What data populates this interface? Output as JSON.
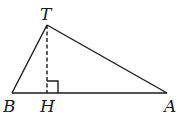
{
  "diagram": {
    "type": "triangle-with-altitude",
    "colors": {
      "stroke": "#1a1a1a",
      "background": "#ffffff"
    },
    "points": {
      "T": {
        "label": "T",
        "x": 47,
        "y": 25
      },
      "B": {
        "label": "B",
        "x": 12,
        "y": 93
      },
      "A": {
        "label": "A",
        "x": 167,
        "y": 93
      },
      "H": {
        "label": "H",
        "x": 47,
        "y": 93
      }
    },
    "segments": [
      {
        "from": "T",
        "to": "B",
        "style": "solid"
      },
      {
        "from": "T",
        "to": "A",
        "style": "solid"
      },
      {
        "from": "B",
        "to": "A",
        "style": "solid"
      },
      {
        "from": "T",
        "to": "H",
        "style": "dashed"
      }
    ],
    "right_angle_at": "H"
  }
}
